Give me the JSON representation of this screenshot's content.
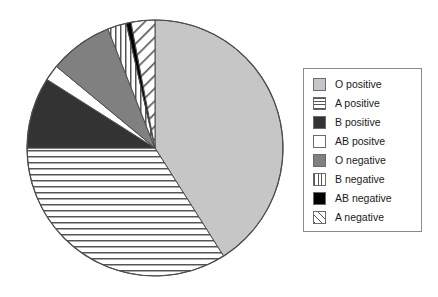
{
  "chart_data": {
    "type": "pie",
    "title": "",
    "categories": [
      "O positive",
      "A positive",
      "B positive",
      "AB positve",
      "O negative",
      "B negative",
      "AB negative",
      "A negative"
    ],
    "values": [
      41,
      34,
      9,
      2,
      8,
      2.4,
      0.6,
      7
    ],
    "units": "percent",
    "start_angle_deg": 0,
    "direction": "clockwise",
    "legend_position": "right",
    "grid": false,
    "slices": [
      {
        "label": "O positive",
        "value": 41,
        "start_deg": 0,
        "end_deg": 147.6,
        "fill": "#c6c6c6",
        "pattern": "solid"
      },
      {
        "label": "A positive",
        "value": 34,
        "start_deg": 147.6,
        "end_deg": 270,
        "fill": "#ffffff",
        "pattern": "horizontal-lines"
      },
      {
        "label": "B positive",
        "value": 9,
        "start_deg": 270,
        "end_deg": 302.4,
        "fill": "#333333",
        "pattern": "solid"
      },
      {
        "label": "AB positve",
        "value": 2,
        "start_deg": 302.4,
        "end_deg": 309.6,
        "fill": "#ffffff",
        "pattern": "solid"
      },
      {
        "label": "O negative",
        "value": 8,
        "start_deg": 309.6,
        "end_deg": 338.4,
        "fill": "#808080",
        "pattern": "solid"
      },
      {
        "label": "B negative",
        "value": 2.4,
        "start_deg": 338.4,
        "end_deg": 347,
        "fill": "#ffffff",
        "pattern": "vertical-lines"
      },
      {
        "label": "AB negative",
        "value": 0.6,
        "start_deg": 347,
        "end_deg": 349.2,
        "fill": "#000000",
        "pattern": "solid"
      },
      {
        "label": "A negative",
        "value": 7,
        "start_deg": 349.2,
        "end_deg": 360,
        "fill": "#ffffff",
        "pattern": "diagonal-lines"
      }
    ]
  },
  "legend": {
    "items": [
      {
        "label": "O positive",
        "swatch": "swatch-solid-light-gray"
      },
      {
        "label": "A positive",
        "swatch": "swatch-horizontal-lines"
      },
      {
        "label": "B positive",
        "swatch": "swatch-solid-dark-gray"
      },
      {
        "label": "AB positve",
        "swatch": "swatch-solid-white"
      },
      {
        "label": "O negative",
        "swatch": "swatch-solid-medium-gray"
      },
      {
        "label": "B negative",
        "swatch": "swatch-vertical-lines"
      },
      {
        "label": "AB negative",
        "swatch": "swatch-solid-black"
      },
      {
        "label": "A negative",
        "swatch": "swatch-diagonal-lines"
      }
    ]
  },
  "colors": {
    "o_positive": "#c6c6c6",
    "b_positive": "#333333",
    "o_negative": "#808080",
    "ab_negative": "#000000",
    "outline": "#4d4d4d",
    "legend_border": "#8a8a8a",
    "text": "#1a1a1a",
    "background": "#ffffff"
  }
}
